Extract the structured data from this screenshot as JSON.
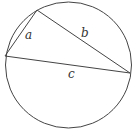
{
  "diagram": {
    "type": "inscribed-triangle",
    "circle": {
      "cx": 68.5,
      "cy": 65,
      "r": 63
    },
    "vertices": {
      "top": {
        "x": 37,
        "y": 10
      },
      "left": {
        "x": 5,
        "y": 56
      },
      "right": {
        "x": 130,
        "y": 73
      }
    },
    "sides": [
      {
        "label": "a",
        "from": "left",
        "to": "top",
        "label_x": 27,
        "label_y": 39
      },
      {
        "label": "b",
        "from": "top",
        "to": "right",
        "label_x": 82,
        "label_y": 37
      },
      {
        "label": "c",
        "from": "left",
        "to": "right",
        "label_x": 69,
        "label_y": 78
      }
    ],
    "stroke_color": "#444444"
  }
}
